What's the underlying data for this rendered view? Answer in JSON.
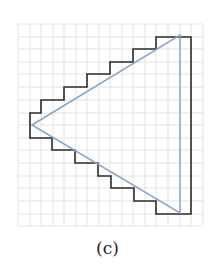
{
  "figure": {
    "caption": "(c)",
    "grid": {
      "x_lines": [
        18,
        30,
        41,
        53,
        64,
        76,
        87,
        99,
        110,
        122,
        133,
        145,
        156,
        168,
        180,
        191,
        203
      ],
      "y_lines": [
        24,
        37,
        49,
        62,
        74,
        87,
        100,
        113,
        125,
        138,
        150,
        163,
        176,
        188,
        201,
        214,
        226
      ],
      "color": "#dcdcdc"
    },
    "staircase_outline": {
      "color": "#2b2b2b",
      "points": "30,138 30,113 41,113 41,100 64,100 64,87 87,87 87,74 110,74 110,62 133,62 133,49 156,49 156,37 191,37 191,214 156,214 156,201 134,201 134,188 111,188 111,176 98,176 98,163 75,163 75,150 52,150 52,138 30,138"
    },
    "triangle": {
      "color": "#88a4c6",
      "points": "32,125 180,35 180,213"
    }
  }
}
